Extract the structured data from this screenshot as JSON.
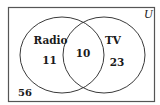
{
  "diagram": {
    "type": "venn",
    "universe_label": "U",
    "sets": [
      {
        "name": "Radio",
        "only_count": "11"
      },
      {
        "name": "TV",
        "only_count": "23"
      }
    ],
    "intersection_count": "10",
    "outside_count": "56"
  },
  "colors": {
    "stroke": "#3a3a3a",
    "frame": "#555555",
    "text": "#1a1a1a",
    "background": "#ffffff"
  }
}
